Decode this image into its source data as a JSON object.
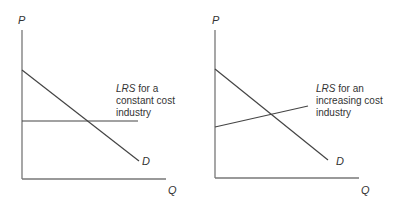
{
  "panels": [
    {
      "y_axis_label": "P",
      "x_axis_label": "Q",
      "demand_label": "D",
      "lrs_label_italic": "LRS",
      "lrs_label_line1_rest": " for a",
      "lrs_label_line2": "constant cost",
      "lrs_label_line3": "industry"
    },
    {
      "y_axis_label": "P",
      "x_axis_label": "Q",
      "demand_label": "D",
      "lrs_label_italic": "LRS",
      "lrs_label_line1_rest": " for an",
      "lrs_label_line2": "increasing cost",
      "lrs_label_line3": "industry"
    }
  ],
  "colors": {
    "line": "#444444",
    "axis": "#777777",
    "text": "#333333"
  }
}
